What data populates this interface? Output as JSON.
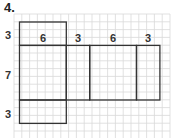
{
  "problem": {
    "number": "4."
  },
  "diagram": {
    "type": "net-on-grid",
    "grid": {
      "x0": 14,
      "y0": 14,
      "cell": 7.8,
      "cols": 20,
      "rows": 16,
      "color": "#d9d9d9"
    },
    "outline_color": "#333333",
    "faces": [
      {
        "name": "top-face",
        "col": 0,
        "row": 0,
        "w": 6,
        "h": 3
      },
      {
        "name": "front-face",
        "col": 0,
        "row": 3,
        "w": 6,
        "h": 7
      },
      {
        "name": "right-face",
        "col": 6,
        "row": 3,
        "w": 3,
        "h": 7
      },
      {
        "name": "back-face",
        "col": 9,
        "row": 3,
        "w": 6,
        "h": 7
      },
      {
        "name": "left-face",
        "col": 15,
        "row": 3,
        "w": 3,
        "h": 7
      },
      {
        "name": "bottom-face",
        "col": 0,
        "row": 10,
        "w": 6,
        "h": 3
      }
    ],
    "labels": [
      {
        "id": "label-top-height",
        "text": "3",
        "x": 8,
        "y": 35
      },
      {
        "id": "label-width-1",
        "text": "6",
        "x": 43,
        "y": 38
      },
      {
        "id": "label-depth-1",
        "text": "3",
        "x": 78,
        "y": 38
      },
      {
        "id": "label-width-2",
        "text": "6",
        "x": 113,
        "y": 38
      },
      {
        "id": "label-depth-2",
        "text": "3",
        "x": 148,
        "y": 38
      },
      {
        "id": "label-height",
        "text": "7",
        "x": 8,
        "y": 75
      },
      {
        "id": "label-bottom-height",
        "text": "3",
        "x": 8,
        "y": 114
      }
    ]
  }
}
